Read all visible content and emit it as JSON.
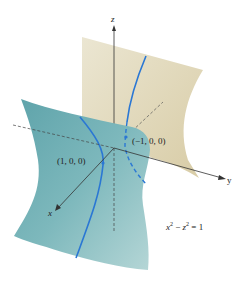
{
  "figure": {
    "type": "3d-surface-diagram",
    "equation": {
      "lhs_x": "x",
      "sup_x": "2",
      "minus": " − ",
      "lhs_z": "z",
      "sup_z": "2",
      "rhs": " = 1"
    },
    "axes": {
      "x_label": "x",
      "y_label": "y",
      "z_label": "z"
    },
    "points": [
      {
        "label": "(1, 0, 0)"
      },
      {
        "label": "(−1, 0, 0)"
      }
    ],
    "colors": {
      "front_surface": "#6fb0b5",
      "front_surface_light": "#a9d0d2",
      "back_surface": "#e3dcc2",
      "back_surface_dark": "#cfc29a",
      "curve": "#2a77d4",
      "axis": "#333333",
      "background": "#ffffff"
    }
  }
}
